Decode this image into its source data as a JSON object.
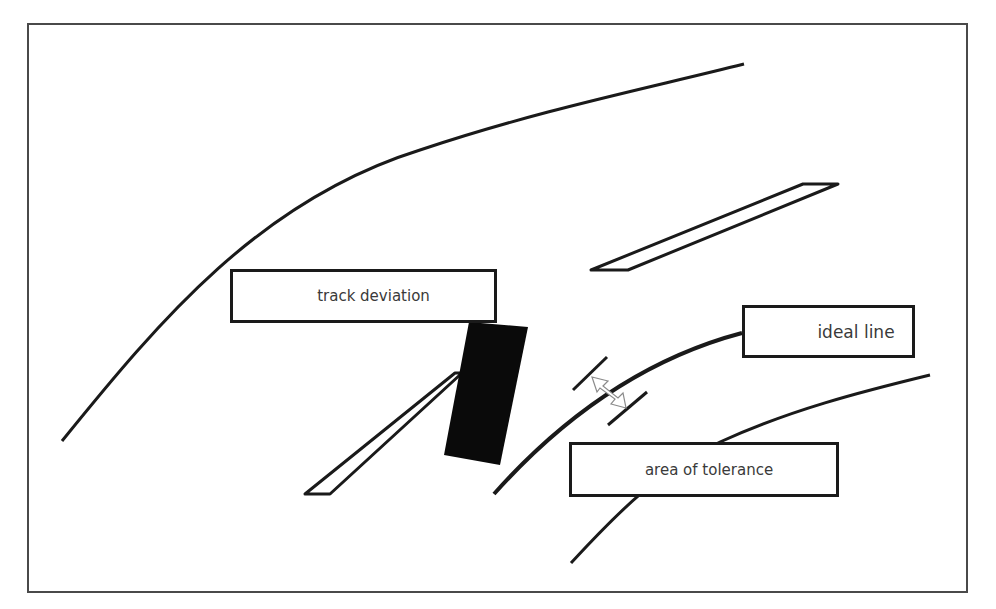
{
  "diagram": {
    "type": "racing line schematic",
    "labels": {
      "track_deviation": "track deviation",
      "ideal_line": "ideal line",
      "area_of_tolerance": "area of tolerance"
    },
    "colors": {
      "stroke": "#1a1a1a",
      "vehicle_fill": "#0a0a0a",
      "tolerance_arrow": "#8a8a8a",
      "frame": "#4a4a4a",
      "label_text": "#3a3a3a"
    },
    "icons": {
      "vehicle": "black-rectangle",
      "tolerance_marker": "double-headed-arrow-outline"
    }
  }
}
